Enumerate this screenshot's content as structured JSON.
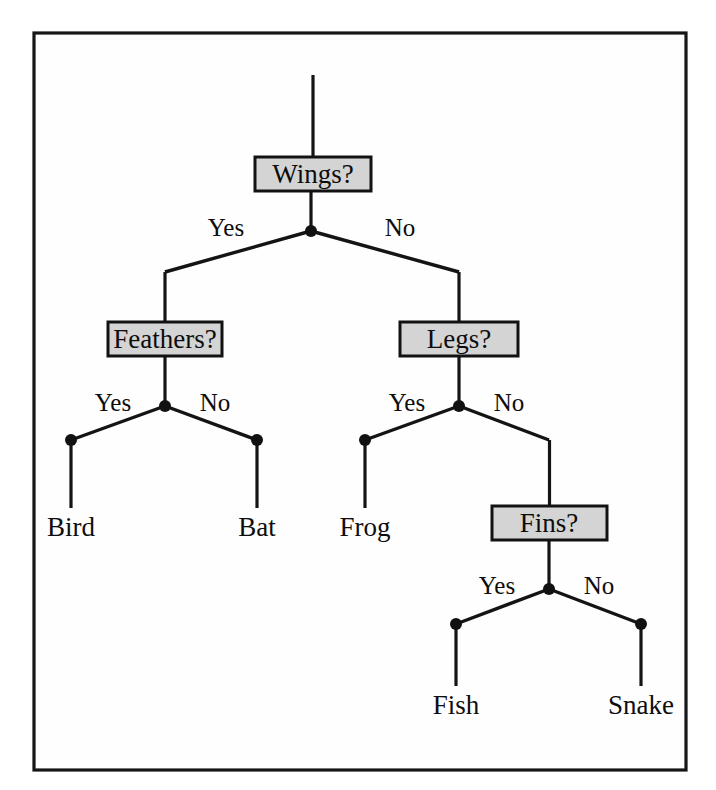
{
  "figure": {
    "type": "decision-tree",
    "background_color": "#ffffff",
    "frame": {
      "x": 34,
      "y": 33,
      "width": 652,
      "height": 737,
      "stroke_color": "#161616",
      "fill_color": "#fefefe"
    },
    "style": {
      "box_fill": "#d4d4d4",
      "box_stroke": "#121212",
      "line_color": "#141414",
      "dot_color": "#111111",
      "dot_radius": 6
    }
  },
  "decision_nodes": [
    {
      "id": "wings",
      "label": "Wings?",
      "box": {
        "x": 255,
        "y": 157,
        "width": 116,
        "height": 34
      },
      "text_x": 313,
      "text_y": 183,
      "junction": {
        "x": 311,
        "y": 231
      },
      "stem_top_y": 75,
      "stem_bottom_y": 157
    },
    {
      "id": "feathers",
      "label": "Feathers?",
      "box": {
        "x": 108,
        "y": 322,
        "width": 114,
        "height": 34
      },
      "text_x": 165,
      "text_y": 348,
      "junction": {
        "x": 165,
        "y": 406
      },
      "stem_top_y": 272,
      "stem_bottom_y": 322
    },
    {
      "id": "legs",
      "label": "Legs?",
      "box": {
        "x": 400,
        "y": 322,
        "width": 118,
        "height": 34
      },
      "text_x": 459,
      "text_y": 348,
      "junction": {
        "x": 459,
        "y": 406
      },
      "stem_top_y": 272,
      "stem_bottom_y": 322
    },
    {
      "id": "fins",
      "label": "Fins?",
      "box": {
        "x": 492,
        "y": 506,
        "width": 115,
        "height": 34
      },
      "text_x": 549,
      "text_y": 532,
      "junction": {
        "x": 549,
        "y": 589
      },
      "stem_top_y": 440,
      "stem_bottom_y": 506
    }
  ],
  "leaf_nodes": [
    {
      "id": "bird",
      "label": "Bird",
      "dot": {
        "x": 71,
        "y": 440
      },
      "stem_bottom_y": 508,
      "text_x": 71,
      "text_y": 536
    },
    {
      "id": "bat",
      "label": "Bat",
      "dot": {
        "x": 257,
        "y": 440
      },
      "stem_bottom_y": 508,
      "text_x": 257,
      "text_y": 536
    },
    {
      "id": "frog",
      "label": "Frog",
      "dot": {
        "x": 365,
        "y": 440
      },
      "stem_bottom_y": 508,
      "text_x": 365,
      "text_y": 536
    },
    {
      "id": "fish",
      "label": "Fish",
      "dot": {
        "x": 456,
        "y": 624
      },
      "stem_bottom_y": 686,
      "text_x": 456,
      "text_y": 714
    },
    {
      "id": "snake",
      "label": "Snake",
      "dot": {
        "x": 641,
        "y": 624
      },
      "stem_bottom_y": 686,
      "text_x": 641,
      "text_y": 714
    }
  ],
  "edges": [
    {
      "id": "wings-yes",
      "from": "wings",
      "to": "feathers",
      "x1": 311,
      "y1": 231,
      "x2": 165,
      "y2": 272
    },
    {
      "id": "wings-no",
      "from": "wings",
      "to": "legs",
      "x1": 311,
      "y1": 231,
      "x2": 459,
      "y2": 272
    },
    {
      "id": "feathers-yes",
      "from": "feathers",
      "to": "bird",
      "x1": 165,
      "y1": 406,
      "x2": 71,
      "y2": 440
    },
    {
      "id": "feathers-no",
      "from": "feathers",
      "to": "bat",
      "x1": 165,
      "y1": 406,
      "x2": 257,
      "y2": 440
    },
    {
      "id": "legs-yes",
      "from": "legs",
      "to": "frog",
      "x1": 459,
      "y1": 406,
      "x2": 365,
      "y2": 440
    },
    {
      "id": "legs-no",
      "from": "legs",
      "to": "fins",
      "x1": 459,
      "y1": 406,
      "x2": 549,
      "y2": 440
    },
    {
      "id": "fins-yes",
      "from": "fins",
      "to": "fish",
      "x1": 549,
      "y1": 589,
      "x2": 456,
      "y2": 624
    },
    {
      "id": "fins-no",
      "from": "fins",
      "to": "snake",
      "x1": 549,
      "y1": 589,
      "x2": 641,
      "y2": 624
    }
  ],
  "branch_labels": [
    {
      "id": "wings-yes-label",
      "text": "Yes",
      "x": 226,
      "y": 236
    },
    {
      "id": "wings-no-label",
      "text": "No",
      "x": 400,
      "y": 236
    },
    {
      "id": "feathers-yes-label",
      "text": "Yes",
      "x": 113,
      "y": 411
    },
    {
      "id": "feathers-no-label",
      "text": "No",
      "x": 215,
      "y": 411
    },
    {
      "id": "legs-yes-label",
      "text": "Yes",
      "x": 407,
      "y": 411
    },
    {
      "id": "legs-no-label",
      "text": "No",
      "x": 509,
      "y": 411
    },
    {
      "id": "fins-yes-label",
      "text": "Yes",
      "x": 497,
      "y": 594
    },
    {
      "id": "fins-no-label",
      "text": "No",
      "x": 599,
      "y": 594
    }
  ]
}
